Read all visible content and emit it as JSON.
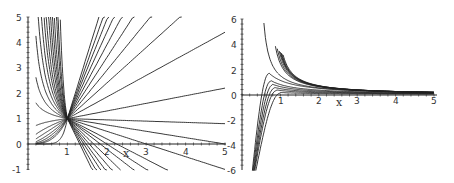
{
  "chart_data": [
    {
      "type": "line",
      "title": "",
      "xlabel": "x",
      "ylabel": "",
      "xlim": [
        0,
        5
      ],
      "ylim": [
        -1,
        5
      ],
      "x_ticks": [
        "1",
        "2",
        "3",
        "4",
        "5"
      ],
      "y_ticks": [
        "-1",
        "0",
        "1",
        "2",
        "3",
        "4",
        "5"
      ],
      "grid": false,
      "legend": null,
      "description": "Family of solution curves all passing through the point (1, 1); for x<1 most curves blow up toward +inf near x=0, one tends to 0; for x>1 they fan out as near-straight lines with slopes from steeply positive to steeply negative",
      "common_point": [
        1,
        1
      ],
      "right_side_slopes": [
        -3.2,
        -2.8,
        -2.4,
        -2.1,
        -1.8,
        -1.5,
        -1.2,
        -1.0,
        -0.8,
        -0.5,
        -0.25,
        -0.05,
        0.3,
        0.85,
        1.4,
        1.9,
        2.4,
        2.9,
        3.4,
        3.9,
        4.4,
        5.0
      ],
      "left_side_exponents": [
        -8,
        -6,
        -5,
        -4,
        -3.4,
        -2.9,
        -2.5,
        -2.1,
        -1.8,
        -1.5,
        -1.2,
        -0.9,
        -0.6,
        -0.3,
        0.2,
        0.6,
        1.0,
        1.5,
        2.0,
        2.6,
        3.2,
        8
      ]
    },
    {
      "type": "line",
      "title": "",
      "xlabel": "x",
      "ylabel": "",
      "xlim": [
        0,
        5
      ],
      "ylim": [
        -6,
        6
      ],
      "x_ticks": [
        "1",
        "2",
        "3",
        "4",
        "5"
      ],
      "y_ticks": [
        "-6",
        "-4",
        "-2",
        "0",
        "2",
        "4",
        "6"
      ],
      "grid": false,
      "legend": null,
      "description": "Family of curves: upper group decays from +inf near x~0.5-1 toward 0 like 1/x; middle group rises from -6 near x~0.3 to a small hump then flattens near 0; lower group has a maximum near x~0.6, y~-2.3 then falls to -inf at finite x (between ~1.0 and ~4.9)",
      "upper_branch_poles": [
        0.55,
        0.85,
        0.9,
        0.95,
        0.98,
        1.0,
        1.02,
        1.05
      ],
      "middle_branch_peaks": [
        [
          0.7,
          1.7
        ],
        [
          0.75,
          1.1
        ],
        [
          0.8,
          0.8
        ],
        [
          0.85,
          0.55
        ],
        [
          0.9,
          0.35
        ],
        [
          1.0,
          0.15
        ]
      ],
      "lower_branch_blowup_x": [
        4.95,
        2.05,
        1.55,
        1.35,
        1.25,
        1.15,
        1.1,
        1.05,
        1.0,
        0.98
      ]
    }
  ],
  "left_plot": {
    "x_axis_label": "x",
    "x_tick_labels": [
      "1",
      "2",
      "3",
      "4",
      "5"
    ],
    "y_tick_labels": [
      "5",
      "4",
      "3",
      "2",
      "1",
      "0",
      "-1"
    ]
  },
  "right_plot": {
    "x_axis_label": "x",
    "x_tick_labels": [
      "1",
      "2",
      "3",
      "4",
      "5"
    ],
    "y_tick_labels": [
      "6",
      "4",
      "2",
      "0",
      "-2",
      "-4",
      "-6"
    ]
  }
}
